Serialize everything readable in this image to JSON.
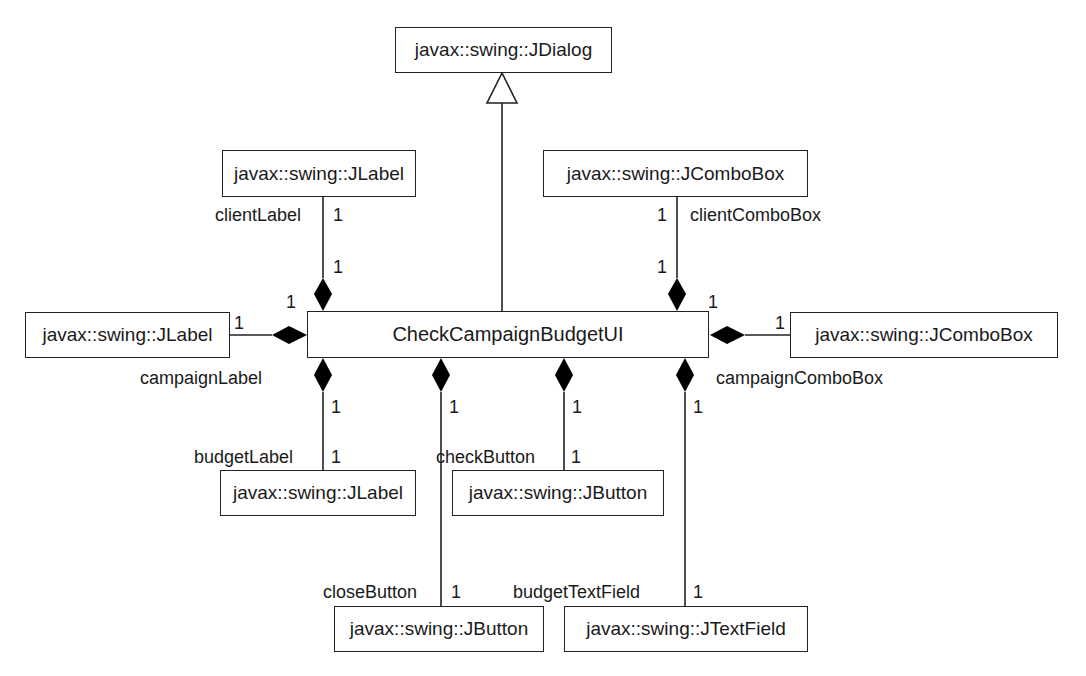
{
  "diagram": {
    "type": "UML class diagram",
    "main_class": "CheckCampaignBudgetUI",
    "superclass": "javax::swing::JDialog",
    "classes": {
      "jdialog": "javax::swing::JDialog",
      "client_label_class": "javax::swing::JLabel",
      "client_combo_class": "javax::swing::JComboBox",
      "campaign_label_class": "javax::swing::JLabel",
      "campaign_combo_class": "javax::swing::JComboBox",
      "budget_label_class": "javax::swing::JLabel",
      "check_button_class": "javax::swing::JButton",
      "close_button_class": "javax::swing::JButton",
      "budget_textfield_class": "javax::swing::JTextField"
    },
    "roles": {
      "client_label": "clientLabel",
      "client_combo": "clientComboBox",
      "campaign_label": "campaignLabel",
      "campaign_combo": "campaignComboBox",
      "budget_label": "budgetLabel",
      "check_button": "checkButton",
      "close_button": "closeButton",
      "budget_textfield": "budgetTextField"
    },
    "multiplicity": "1"
  }
}
